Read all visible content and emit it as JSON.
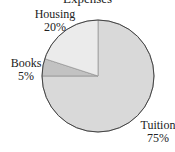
{
  "chart_data": {
    "type": "pie",
    "title": "Expenses",
    "categories": [
      "Tuition",
      "Books",
      "Housing"
    ],
    "values": [
      75,
      5,
      20
    ],
    "labels": [
      "Tuition\n75%",
      "Books\n5%",
      "Housing\n20%"
    ],
    "colors": [
      "#d9d9d9",
      "#c2c2c2",
      "#ebebeb"
    ]
  },
  "labels": {
    "housing_name": "Housing",
    "housing_pct": "20%",
    "books_name": "Books",
    "books_pct": "5%",
    "tuition_name": "Tuition",
    "tuition_pct": "75%"
  }
}
